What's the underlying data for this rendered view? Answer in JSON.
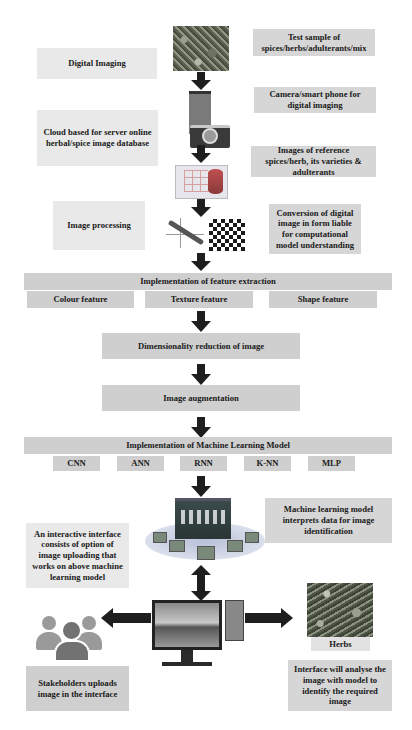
{
  "top_section": {
    "left_labels": {
      "digital_imaging": "Digital Imaging",
      "cloud_database": "Cloud based for server online herbal/spice image database",
      "image_processing": "Image processing"
    },
    "right_labels": {
      "test_sample": "Test sample of spices/herbs/adulterants/mix",
      "camera": "Camera/smart phone for digital imaging",
      "reference_images": "Images of reference spices/herb, its varieties & adulterants",
      "conversion": "Conversion of digital image in form liable for computational model understanding"
    },
    "icons": [
      "herb-photo",
      "smartphone-camera-icon",
      "database-icon",
      "graph-icon",
      "checkerboard-icon"
    ]
  },
  "feature_extraction": {
    "title": "Implementation of feature extraction",
    "features": [
      "Colour feature",
      "Texture feature",
      "Shape feature"
    ]
  },
  "dimensionality": "Dimensionality reduction of image",
  "augmentation": "Image augmentation",
  "ml_model": {
    "title": "Implementation of Machine Learning Model",
    "models": [
      "CNN",
      "ANN",
      "RNN",
      "K-NN",
      "MLP"
    ]
  },
  "bottom_section": {
    "ml_interprets": "Machine learning model interprets data for image identification",
    "interactive_interface": "An interactive interface consists of option of image uploading that works on above machine learning model",
    "stakeholders": "Stakeholders uploads image in the interface",
    "herbs_label": "Herbs",
    "interface_analyse": "Interface will analyse the image with model to identify the required image"
  },
  "colors": {
    "arrow": "#1e1e1e",
    "box_light": "#e9e9e9",
    "box_mid": "#d6d6d6",
    "people": "#8a8a8a"
  }
}
